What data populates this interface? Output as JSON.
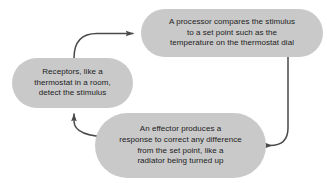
{
  "diagram": {
    "canvas": {
      "width": 327,
      "height": 183
    },
    "colors": {
      "background": "#ffffff",
      "node_fill": "#c9c9c9",
      "node_text": "#1c1c1c",
      "arrow": "#4a4a4a"
    },
    "nodes": [
      {
        "id": "receptors",
        "label": "Receptors, like a\nthermostat in a room,\ndetect the stimulus",
        "lines": [
          "Receptors, like a",
          "thermostat in a room,",
          "detect the stimulus"
        ]
      },
      {
        "id": "processor",
        "label": "A processor compares the stimulus\nto a set point such as the\ntemperature on the thermostat dial",
        "lines": [
          "A processor compares the stimulus",
          "to a set point such as the",
          "temperature on the thermostat dial"
        ]
      },
      {
        "id": "effector",
        "label": "An effector produces a\nresponse to correct any difference\nfrom the set point, like a\nradiator being turned up",
        "lines": [
          "An effector produces a",
          "response to correct any difference",
          "from the set point, like a",
          "radiator being turned up"
        ]
      }
    ],
    "arrows": [
      {
        "id": "receptors-to-processor",
        "from": "receptors",
        "to": "processor",
        "direction": "right"
      },
      {
        "id": "processor-to-effector",
        "from": "processor",
        "to": "effector",
        "direction": "left"
      },
      {
        "id": "effector-to-receptors",
        "from": "effector",
        "to": "receptors",
        "direction": "up"
      }
    ]
  }
}
